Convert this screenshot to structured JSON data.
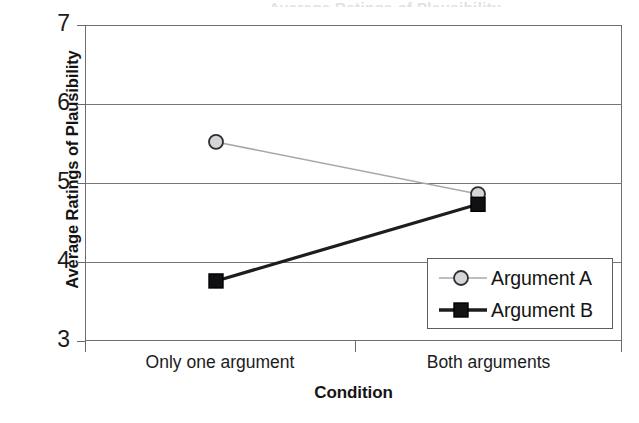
{
  "figure": {
    "cropped_title": "Average Ratings of Plausibility",
    "background_color": "#ffffff"
  },
  "chart_data": {
    "type": "line",
    "title": "",
    "xlabel": "Condition",
    "ylabel": "Average Ratings of Plausibility",
    "categories": [
      "Only one argument",
      "Both arguments"
    ],
    "xtick_labels": [
      "Only one argument",
      "Both arguments"
    ],
    "ytick_labels": [
      "3",
      "4",
      "5",
      "6",
      "7"
    ],
    "yticks": [
      3,
      4,
      5,
      6,
      7
    ],
    "ylim": [
      3,
      7
    ],
    "grid": true,
    "grid_axis": "y",
    "legend_position": "lower right",
    "series": [
      {
        "name": "Argument A",
        "values": [
          5.52,
          4.86
        ],
        "color": "#a8a8ac",
        "marker": "open-circle",
        "marker_face": "#d5d5d8",
        "marker_edge": "#2c2c30",
        "line_width": 1.6
      },
      {
        "name": "Argument B",
        "values": [
          3.76,
          4.73
        ],
        "color": "#1d1d1f",
        "marker": "filled-square",
        "marker_face": "#111113",
        "marker_edge": "#000000",
        "line_width": 3.2
      }
    ]
  },
  "legend": {
    "entries": [
      {
        "label": "Argument A"
      },
      {
        "label": "Argument B"
      }
    ]
  }
}
